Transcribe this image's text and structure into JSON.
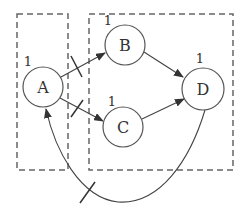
{
  "diagram": {
    "type": "directed-graph",
    "colors": {
      "stroke": "#555555",
      "dashed": "#666666",
      "text": "#333333",
      "background": "#ffffff"
    },
    "groups": [
      {
        "id": "left-group",
        "members": [
          "A"
        ]
      },
      {
        "id": "right-group",
        "members": [
          "B",
          "C",
          "D"
        ]
      }
    ],
    "nodes": [
      {
        "id": "A",
        "label": "A",
        "weight": "1"
      },
      {
        "id": "B",
        "label": "B",
        "weight": "1"
      },
      {
        "id": "C",
        "label": "C",
        "weight": "1"
      },
      {
        "id": "D",
        "label": "D",
        "weight": "1"
      }
    ],
    "edges": [
      {
        "from": "A",
        "to": "B",
        "cut": true
      },
      {
        "from": "A",
        "to": "C",
        "cut": true
      },
      {
        "from": "B",
        "to": "D",
        "cut": false
      },
      {
        "from": "C",
        "to": "D",
        "cut": false
      },
      {
        "from": "D",
        "to": "A",
        "cut": true,
        "curved": true
      }
    ]
  }
}
